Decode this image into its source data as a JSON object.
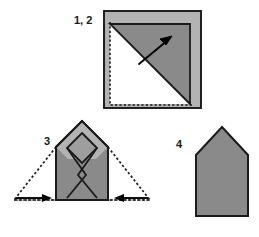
{
  "figure": {
    "type": "origami-folding-diagram",
    "background_color": "#ffffff",
    "colors": {
      "paper_front": "#8a8a8a",
      "paper_back": "#b3b3b3",
      "paper_shadow": "#9e9e9e",
      "paper_white": "#ffffff",
      "outline": "#1a1a1a",
      "crease_dotted": "#1a1a1a",
      "arrow": "#000000",
      "label_text": "#1a1a1a"
    },
    "panels": [
      {
        "id": "panel-1-2",
        "label": "1, 2",
        "description": "square sheet with corner folded along diagonal",
        "shape": "square",
        "has_dotted_outline": true,
        "arrow": "diagonal-up-right"
      },
      {
        "id": "panel-3",
        "label": "3",
        "description": "house shape with nested diamond creases and side flaps folding in",
        "shape": "pentagon",
        "has_dotted_outline": true,
        "arrows": [
          "right",
          "left"
        ]
      },
      {
        "id": "panel-4",
        "label": "4",
        "description": "finished house shape",
        "shape": "pentagon",
        "has_dotted_outline": false,
        "arrows": []
      }
    ]
  }
}
